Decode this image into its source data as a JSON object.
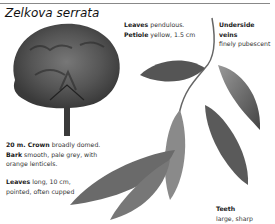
{
  "header": {
    "title": "Zelkova serrata"
  },
  "annotations": {
    "leaves_top": {
      "bold1": "Leaves",
      "text1": " pendulous.",
      "bold2": "Petiole",
      "text2": " yellow, 1.5 cm"
    },
    "underside": {
      "bold": "Underside veins",
      "text": "finely pubescent"
    },
    "crown": {
      "bold1": "20 m. Crown",
      "text1": " broadly domed.",
      "bold2": "Bark",
      "text2": " smooth, pale grey, with orange lenticels."
    },
    "leaves_bottom": {
      "bold": "Leaves",
      "text": " long, 10 cm, pointed, often cupped"
    },
    "teeth": {
      "bold": "Teeth",
      "text": "large, sharp"
    }
  },
  "illustrations": {
    "tree": "tree-crown-illustration",
    "branch": "leafy-twig-illustration"
  }
}
